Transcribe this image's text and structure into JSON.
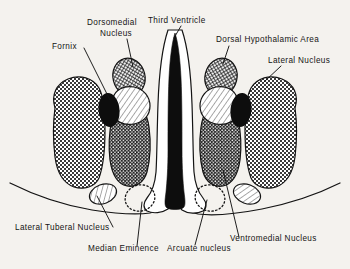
{
  "figure": {
    "background_color": "#f4f2ee",
    "ink_color": "#141414"
  },
  "labels": {
    "fornix": "Fornix",
    "dorsomedial_nucleus_line1": "Dorsomedial",
    "dorsomedial_nucleus_line2": "Nucleus",
    "third_ventricle": "Third Ventricle",
    "dorsal_hypothalamic_area": "Dorsal Hypothalamic Area",
    "lateral_nucleus": "Lateral Nucleus",
    "lateral_tuberal_nucleus": "Lateral Tuberal Nucleus",
    "median_eminence": "Median Eminence",
    "arcuate_nucleus": "Arcuate nucleus",
    "ventromedial_nucleus": "Ventromedial Nucleus"
  },
  "structures": [
    {
      "name": "lateral-nucleus-left",
      "label": "Lateral Nucleus",
      "fill": "checker-light",
      "side": "left"
    },
    {
      "name": "lateral-nucleus-right",
      "label": "Lateral Nucleus",
      "fill": "checker-light",
      "side": "right"
    },
    {
      "name": "ventromedial-nucleus-left",
      "label": "Ventromedial Nucleus",
      "fill": "checker-dark",
      "side": "left"
    },
    {
      "name": "ventromedial-nucleus-right",
      "label": "Ventromedial Nucleus",
      "fill": "checker-dark",
      "side": "right"
    },
    {
      "name": "dorsomedial-nucleus-left",
      "label": "Dorsomedial Nucleus",
      "fill": "crosshatch",
      "side": "left"
    },
    {
      "name": "dorsal-hypothalamic-area-right",
      "label": "Dorsal Hypothalamic Area",
      "fill": "crosshatch",
      "side": "right"
    },
    {
      "name": "anterior-nucleus-left",
      "label": "",
      "fill": "diagonal-hatch",
      "side": "left"
    },
    {
      "name": "anterior-nucleus-right",
      "label": "",
      "fill": "diagonal-hatch",
      "side": "right"
    },
    {
      "name": "fornix-left",
      "label": "Fornix",
      "fill": "solid-black",
      "side": "left"
    },
    {
      "name": "fornix-right",
      "label": "Fornix",
      "fill": "solid-black",
      "side": "right"
    },
    {
      "name": "lateral-tuberal-nucleus-left",
      "label": "Lateral Tuberal Nucleus",
      "fill": "diagonal-hatch",
      "side": "left"
    },
    {
      "name": "lateral-tuberal-nucleus-right",
      "label": "Lateral Tuberal Nucleus",
      "fill": "diagonal-hatch",
      "side": "right"
    },
    {
      "name": "median-eminence-left",
      "label": "Median Eminence",
      "fill": "dotted-outline",
      "side": "left"
    },
    {
      "name": "arcuate-nucleus-right",
      "label": "Arcuate nucleus",
      "fill": "dotted-outline",
      "side": "right"
    },
    {
      "name": "third-ventricle",
      "label": "Third Ventricle",
      "fill": "solid-black",
      "side": "center"
    }
  ]
}
